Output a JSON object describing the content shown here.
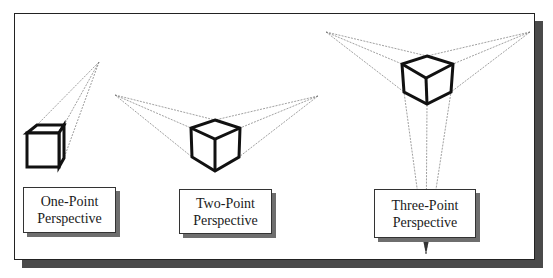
{
  "diagram": {
    "type": "perspective-drawing-comparison",
    "colors": {
      "frame_border": "#222222",
      "frame_shadow": "#4a4a4a",
      "cube_stroke": "#111111",
      "guide_line": "#777777",
      "label_text": "#1a1a1a"
    },
    "panels": [
      {
        "id": "one-point",
        "label_line1": "One-Point",
        "label_line2": "Perspective",
        "vanishing_points": [
          [
            99,
            62
          ]
        ]
      },
      {
        "id": "two-point",
        "label_line1": "Two-Point",
        "label_line2": "Perspective",
        "vanishing_points": [
          [
            115,
            95
          ],
          [
            318,
            96
          ]
        ]
      },
      {
        "id": "three-point",
        "label_line1": "Three-Point",
        "label_line2": "Perspective",
        "vanishing_points": [
          [
            326,
            32
          ],
          [
            530,
            32
          ],
          [
            426,
            254
          ]
        ]
      }
    ]
  }
}
